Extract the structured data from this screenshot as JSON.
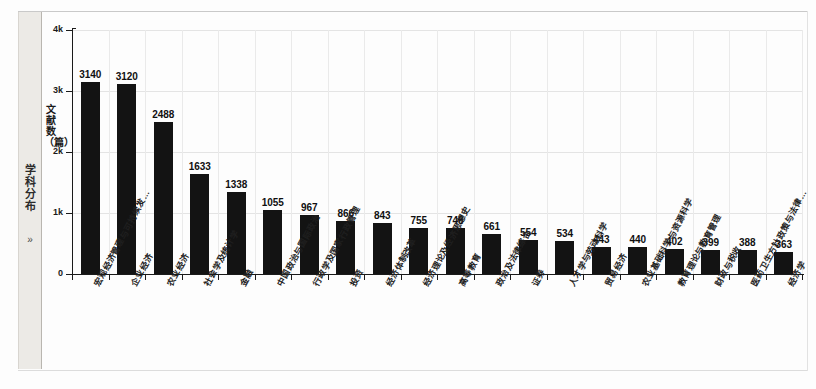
{
  "sidebar": {
    "tab_label": "学科分布",
    "chevron": "»"
  },
  "chart_data": {
    "type": "bar",
    "title": "",
    "xlabel": "",
    "ylabel": "文献数（篇）",
    "ylim": [
      0,
      4000
    ],
    "ytick_labels": [
      "0",
      "1k",
      "2k",
      "3k",
      "4k"
    ],
    "ytick_values": [
      0,
      1000,
      2000,
      3000,
      4000
    ],
    "grid": true,
    "legend": "none",
    "bar_color": "#131313",
    "grid_color": "#e4e4e4",
    "axis_color": "#1a1a1a",
    "categories": [
      "宏观经济管理与可持续发…",
      "企业经济",
      "农业经济",
      "社会学及统计学",
      "金融",
      "中国政治与国际政治",
      "行政学及国家行政管理",
      "投资",
      "经济体制改革",
      "经济理论及经济思想史",
      "高等教育",
      "政治及法律综合",
      "证券",
      "人才学与劳动科学",
      "贸易经济",
      "农业基础科学与资源科学",
      "教育理论与教育管理",
      "财政与税收",
      "医药卫生方针政策与法律…",
      "经济学"
    ],
    "values": [
      3140,
      3120,
      2488,
      1633,
      1338,
      1055,
      967,
      866,
      843,
      755,
      748,
      661,
      554,
      534,
      443,
      440,
      402,
      399,
      388,
      363
    ]
  }
}
